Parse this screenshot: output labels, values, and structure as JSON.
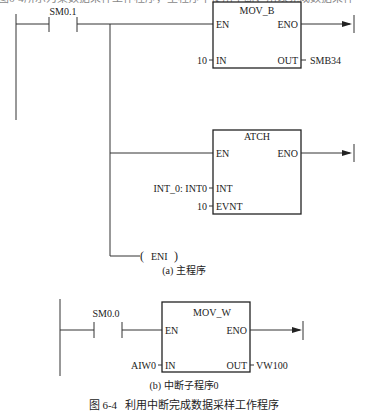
{
  "top_cut_text": "图6-4所示为某数据采样工作程序，主程序中使用中断，用以完成数据采样",
  "main_program": {
    "caption": "(a) 主程序",
    "contact": {
      "label": "SM0.1",
      "type": "normally-open"
    },
    "mov_b": {
      "title": "MOV_B",
      "en": "EN",
      "eno": "ENO",
      "in_pin": "IN",
      "out_pin": "OUT",
      "in_value": "10",
      "out_value": "SMB34"
    },
    "atch": {
      "title": "ATCH",
      "en": "EN",
      "eno": "ENO",
      "int_pin": "INT",
      "evnt_pin": "EVNT",
      "int_value": "INT_0: INT0",
      "evnt_value": "10"
    },
    "coil": {
      "label": "ENI"
    }
  },
  "interrupt_routine": {
    "caption": "(b) 中断子程序0",
    "contact": {
      "label": "SM0.0",
      "type": "normally-open"
    },
    "mov_w": {
      "title": "MOV_W",
      "en": "EN",
      "eno": "ENO",
      "in_pin": "IN",
      "out_pin": "OUT",
      "in_value": "AIW0",
      "out_value": "VW100"
    }
  },
  "figure_caption": "图 6-4   利用中断完成数据采样工作程序"
}
